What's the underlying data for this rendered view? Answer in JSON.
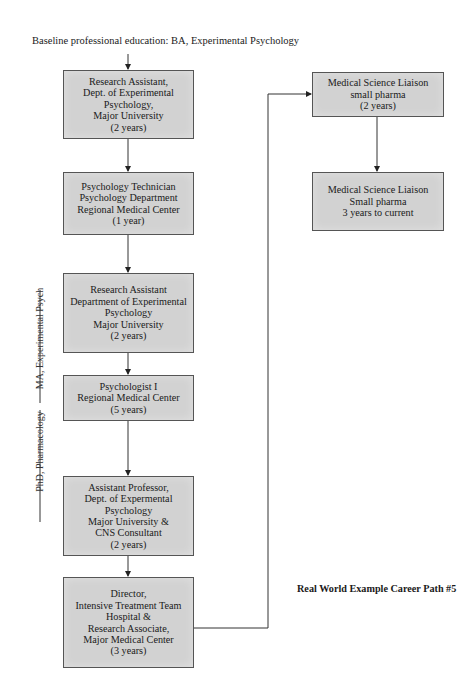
{
  "baseline_text": "Baseline professional education: BA, Experimental Psychology",
  "caption": "Real World Example Career Path #5",
  "side_labels": [
    {
      "label": "MA, Experimental Psych"
    },
    {
      "label": "PhD, Pharmacology"
    }
  ],
  "left_column": [
    {
      "lines": [
        "Research Assistant,",
        "Dept. of Experimental",
        "Psychology,",
        "Major University",
        "(2 years)"
      ]
    },
    {
      "lines": [
        "Psychology Technician",
        "Psychology Department",
        "Regional Medical Center",
        "(1 year)"
      ]
    },
    {
      "lines": [
        "Research Assistant",
        "Department of Experimental",
        "Psychology",
        "Major University",
        "(2 years)"
      ]
    },
    {
      "lines": [
        "Psychologist I",
        "Regional Medical Center",
        "(5 years)"
      ]
    },
    {
      "lines": [
        "Assistant Professor,",
        "Dept. of Expermental",
        "Psychology",
        "Major University &",
        "CNS Consultant",
        "(2 years)"
      ]
    },
    {
      "lines": [
        "Director,",
        "Intensive Treatment Team",
        "Hospital &",
        "Research Associate,",
        "Major Medical Center",
        "(3 years)"
      ]
    }
  ],
  "right_column": [
    {
      "lines": [
        "Medical Science Liaison",
        "small pharma",
        "(2 years)"
      ]
    },
    {
      "lines": [
        "Medical Science Liaison",
        "Small pharma",
        "3 years to current"
      ]
    }
  ],
  "colors": {
    "box_fill": "#d2d2d2",
    "box_border": "#555555",
    "line": "#333333"
  }
}
